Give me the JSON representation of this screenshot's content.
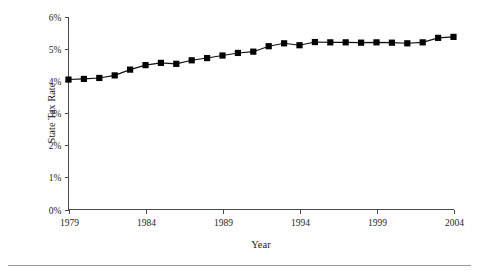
{
  "chart_data": {
    "type": "line",
    "title": "",
    "subtitle": "",
    "xlabel": "Year",
    "ylabel": "State Tax Rate",
    "xlim": [
      1979,
      2004
    ],
    "ylim": [
      0,
      6
    ],
    "grid": false,
    "legend": null,
    "legend_position": "none",
    "marker": "filled-square",
    "x_tick_labels": [
      "1979",
      "1984",
      "1989",
      "1994",
      "1999",
      "2004"
    ],
    "x_ticks": [
      1979,
      1984,
      1989,
      1994,
      1999,
      2004
    ],
    "y_tick_labels": [
      "0%",
      "1%",
      "2%",
      "3%",
      "4%",
      "5%",
      "6%"
    ],
    "y_ticks": [
      0,
      1,
      2,
      3,
      4,
      5,
      6
    ],
    "x": [
      1979,
      1980,
      1981,
      1982,
      1983,
      1984,
      1985,
      1986,
      1987,
      1988,
      1989,
      1990,
      1991,
      1992,
      1993,
      1994,
      1995,
      1996,
      1997,
      1998,
      1999,
      2000,
      2001,
      2002,
      2003,
      2004
    ],
    "values": [
      4.05,
      4.07,
      4.1,
      4.18,
      4.36,
      4.5,
      4.57,
      4.54,
      4.65,
      4.72,
      4.8,
      4.88,
      4.92,
      5.09,
      5.18,
      5.12,
      5.22,
      5.21,
      5.21,
      5.2,
      5.21,
      5.2,
      5.18,
      5.21,
      5.35,
      5.38
    ],
    "series": [
      {
        "name": "State Tax Rate",
        "values": [
          4.05,
          4.07,
          4.1,
          4.18,
          4.36,
          4.5,
          4.57,
          4.54,
          4.65,
          4.72,
          4.8,
          4.88,
          4.92,
          5.09,
          5.18,
          5.12,
          5.22,
          5.21,
          5.21,
          5.2,
          5.21,
          5.2,
          5.18,
          5.21,
          5.35,
          5.38
        ]
      }
    ],
    "units": "percent",
    "colors": {
      "line": "#101010",
      "marker": "#000000",
      "axis": "#4a4a4a",
      "text": "#1a1a1a",
      "background": "#ffffff"
    }
  }
}
